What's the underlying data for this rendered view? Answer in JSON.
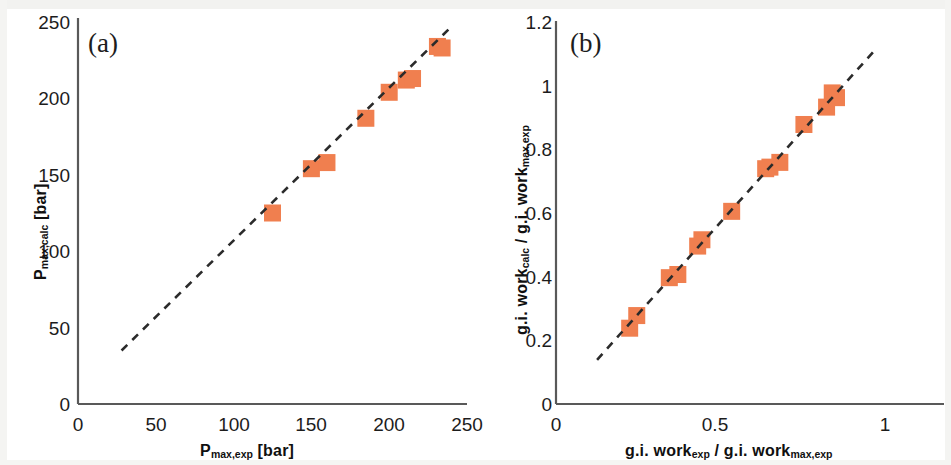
{
  "figure": {
    "marker_color": "#f07f4f",
    "line_color": "#2b2b2b",
    "axis_color": "#595959",
    "text_color": "#1c1c1c",
    "background": "#ffffff"
  },
  "panels": [
    {
      "id": "a",
      "letter": "(a)",
      "chart_data": {
        "type": "scatter",
        "title": "",
        "xlabel_parts": {
          "base": "P",
          "sub": "max,exp",
          "unit": "[bar]"
        },
        "ylabel_parts": {
          "base": "P",
          "sub": "max,calc",
          "unit": "[bar]"
        },
        "xlabel": "P max,exp [bar]",
        "ylabel": "P max,calc [bar]",
        "xlim": [
          0,
          250
        ],
        "ylim": [
          0,
          250
        ],
        "xticks": [
          0,
          50,
          100,
          150,
          200,
          250
        ],
        "yticks": [
          0,
          50,
          100,
          150,
          200,
          250
        ],
        "xticklabels": [
          "0",
          "50",
          "100",
          "150",
          "200",
          "250"
        ],
        "yticklabels": [
          "0",
          "50",
          "100",
          "150",
          "200",
          "250"
        ],
        "grid": false,
        "legend": "none",
        "series": [
          {
            "name": "data",
            "marker": "square",
            "x": [
              125,
              150,
              160,
              185,
              200,
              211,
              215,
              231,
              234
            ],
            "y": [
              125,
              154,
              158,
              187,
              204,
              212,
              213,
              234,
              233
            ]
          },
          {
            "name": "parity line",
            "style": "dashed",
            "x": [
              28,
              240
            ],
            "y": [
              35,
              247
            ]
          }
        ]
      }
    },
    {
      "id": "b",
      "letter": "(b)",
      "chart_data": {
        "type": "scatter",
        "title": "",
        "xlabel_parts": {
          "base1": "g.i. work",
          "sub1": "exp",
          "sep": "/",
          "base2": "g.i. work",
          "sub2": "max,exp"
        },
        "ylabel_parts": {
          "base1": "g.i. work",
          "sub1": "calc",
          "sep": "/",
          "base2": "g.i. work",
          "sub2": "max,exp"
        },
        "xlabel": "g.i. work exp / g.i. work max,exp",
        "ylabel": "g.i. work calc / g.i. work max,exp",
        "xlim": [
          0,
          1.2
        ],
        "ylim": [
          0,
          1.2
        ],
        "xticks": [
          0,
          0.5,
          1
        ],
        "yticks": [
          0,
          0.2,
          0.4,
          0.6,
          0.8,
          1,
          1.2
        ],
        "xticklabels": [
          "0",
          "0.5",
          "1"
        ],
        "yticklabels": [
          "0",
          "0.2",
          "0.4",
          "0.6",
          "0.8",
          "1",
          "1.2"
        ],
        "grid": false,
        "legend": "none",
        "series": [
          {
            "name": "data",
            "marker": "square",
            "x": [
              0.26,
              0.285,
              0.4,
              0.43,
              0.5,
              0.515,
              0.62,
              0.74,
              0.755,
              0.79,
              0.875,
              0.955,
              0.975,
              0.99
            ],
            "y": [
              0.24,
              0.28,
              0.4,
              0.41,
              0.5,
              0.52,
              0.61,
              0.745,
              0.75,
              0.765,
              0.885,
              0.94,
              0.985,
              0.97
            ]
          },
          {
            "name": "parity line",
            "style": "dashed",
            "x": [
              0.145,
              1.13
            ],
            "y": [
              0.14,
              1.125
            ]
          }
        ]
      }
    }
  ]
}
